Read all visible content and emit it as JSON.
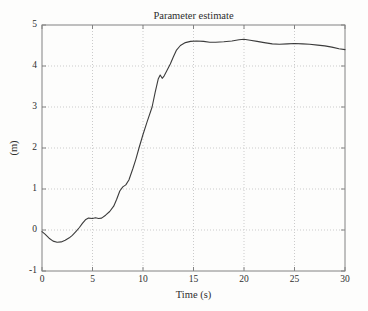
{
  "chart_data": {
    "type": "line",
    "title": "Parameter estimate",
    "xlabel": "Time (s)",
    "ylabel": "(m)",
    "xlim": [
      0,
      30
    ],
    "ylim": [
      -1,
      5
    ],
    "xticks": [
      0,
      5,
      10,
      15,
      20,
      25,
      30
    ],
    "yticks": [
      -1,
      0,
      1,
      2,
      3,
      4,
      5
    ],
    "grid": true,
    "grid_style": "dotted",
    "legend": "none",
    "colors": {
      "line": "#3c3c3c",
      "grid": "#cbcbcb",
      "axis": "#828282",
      "text": "#2e2e2e",
      "background": "#fdfdfc"
    },
    "series": [
      {
        "name": "parameter estimate",
        "points": [
          [
            0.0,
            -0.04
          ],
          [
            0.3,
            -0.1
          ],
          [
            0.7,
            -0.2
          ],
          [
            1.1,
            -0.27
          ],
          [
            1.5,
            -0.3
          ],
          [
            1.9,
            -0.29
          ],
          [
            2.3,
            -0.25
          ],
          [
            2.7,
            -0.19
          ],
          [
            3.0,
            -0.13
          ],
          [
            3.4,
            -0.03
          ],
          [
            3.7,
            0.06
          ],
          [
            4.0,
            0.16
          ],
          [
            4.3,
            0.25
          ],
          [
            4.6,
            0.29
          ],
          [
            5.0,
            0.28
          ],
          [
            5.3,
            0.3
          ],
          [
            5.6,
            0.28
          ],
          [
            5.9,
            0.29
          ],
          [
            6.3,
            0.36
          ],
          [
            6.7,
            0.45
          ],
          [
            7.1,
            0.58
          ],
          [
            7.4,
            0.75
          ],
          [
            7.7,
            0.95
          ],
          [
            8.0,
            1.05
          ],
          [
            8.3,
            1.1
          ],
          [
            8.6,
            1.22
          ],
          [
            9.0,
            1.5
          ],
          [
            9.3,
            1.73
          ],
          [
            9.6,
            2.0
          ],
          [
            10.0,
            2.33
          ],
          [
            10.4,
            2.63
          ],
          [
            10.9,
            3.0
          ],
          [
            11.2,
            3.35
          ],
          [
            11.5,
            3.68
          ],
          [
            11.7,
            3.78
          ],
          [
            11.9,
            3.7
          ],
          [
            12.1,
            3.76
          ],
          [
            12.4,
            3.9
          ],
          [
            12.7,
            4.05
          ],
          [
            13.0,
            4.22
          ],
          [
            13.3,
            4.38
          ],
          [
            13.7,
            4.5
          ],
          [
            14.2,
            4.57
          ],
          [
            14.7,
            4.6
          ],
          [
            15.3,
            4.61
          ],
          [
            16.0,
            4.6
          ],
          [
            16.6,
            4.58
          ],
          [
            17.2,
            4.58
          ],
          [
            18.0,
            4.59
          ],
          [
            18.8,
            4.61
          ],
          [
            19.5,
            4.64
          ],
          [
            20.0,
            4.65
          ],
          [
            20.6,
            4.63
          ],
          [
            21.3,
            4.6
          ],
          [
            22.0,
            4.57
          ],
          [
            22.8,
            4.54
          ],
          [
            23.5,
            4.53
          ],
          [
            24.3,
            4.54
          ],
          [
            25.0,
            4.55
          ],
          [
            25.8,
            4.54
          ],
          [
            26.5,
            4.53
          ],
          [
            27.3,
            4.51
          ],
          [
            28.0,
            4.49
          ],
          [
            28.7,
            4.46
          ],
          [
            29.4,
            4.42
          ],
          [
            30.0,
            4.4
          ]
        ]
      }
    ]
  }
}
